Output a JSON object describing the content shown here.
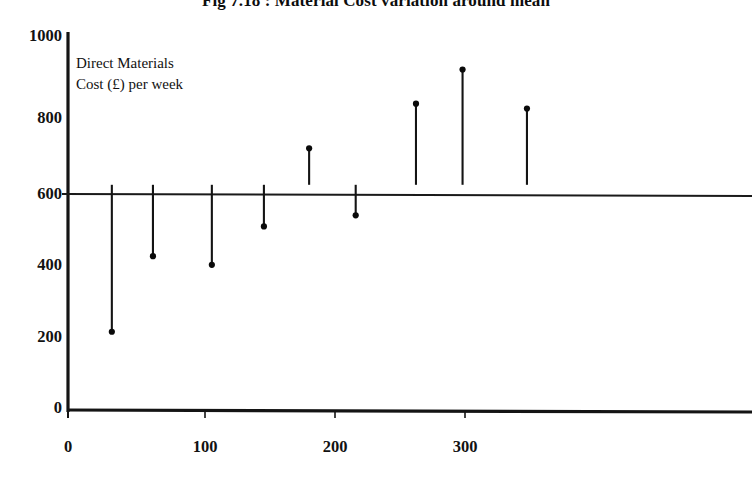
{
  "chart_data": {
    "type": "scatter",
    "title": "Fig 7.18 : Material Cost variation around mean",
    "xlabel": "",
    "ylabel": "",
    "annotation": "Direct Materials\nCost (£) per week",
    "mean_line": 600,
    "xlim": [
      -25,
      360
    ],
    "ylim": [
      0,
      1000
    ],
    "xticks": [
      0,
      100,
      200,
      300
    ],
    "xtick_labels": [
      "0",
      "100",
      "200",
      "300"
    ],
    "yticks": [
      0,
      200,
      400,
      600,
      800,
      1000
    ],
    "ytick_labels": [
      "0",
      "200",
      "400",
      "600",
      "800",
      "1000"
    ],
    "grid": false,
    "legend": false,
    "marker": "filled-circle",
    "stem_baseline": 600,
    "x": [
      32,
      62,
      105,
      143,
      176,
      210,
      254,
      288,
      335
    ],
    "values": [
      205,
      408,
      385,
      488,
      698,
      518,
      818,
      910,
      805
    ],
    "points": [
      {
        "x": 32,
        "y": 205
      },
      {
        "x": 62,
        "y": 408
      },
      {
        "x": 105,
        "y": 385
      },
      {
        "x": 143,
        "y": 488
      },
      {
        "x": 176,
        "y": 698
      },
      {
        "x": 210,
        "y": 518
      },
      {
        "x": 254,
        "y": 818
      },
      {
        "x": 288,
        "y": 910
      },
      {
        "x": 335,
        "y": 805
      }
    ],
    "line_color": "#141414",
    "marker_color": "#0a0a0a",
    "axis_color": "#141414",
    "background": "#ffffff"
  }
}
